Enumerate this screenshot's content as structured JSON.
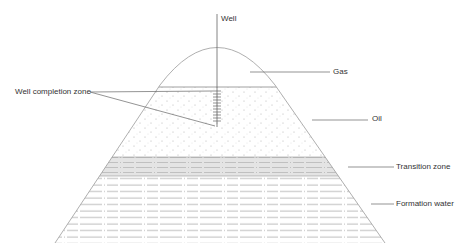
{
  "labels": {
    "well": "Well",
    "gas": "Gas",
    "oil": "Oil",
    "transition_zone": "Transition zone",
    "formation_water": "Formation water",
    "well_completion_zone": "Well completion zone"
  },
  "colors": {
    "line": "#8a8a8a",
    "dark_line": "#555555",
    "transition_fill": "#e6e6e6",
    "dot": "#b5b5b5",
    "text": "#333333"
  }
}
